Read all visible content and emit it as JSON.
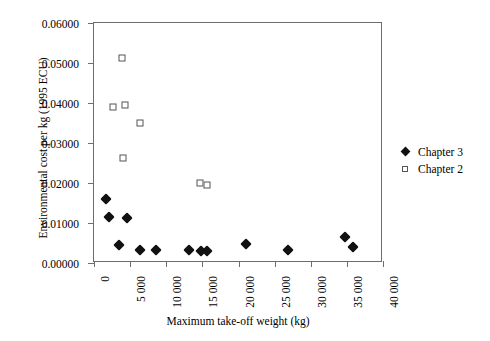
{
  "chart_data": {
    "type": "scatter",
    "title": "",
    "xlabel": "Maximum take-off weight (kg)",
    "ylabel": "Environmental cost per kg (1995 ECU)",
    "xlim": [
      0,
      40000
    ],
    "ylim": [
      0,
      0.06
    ],
    "grid": false,
    "legend_position": "right",
    "xticks": [
      0,
      5000,
      10000,
      15000,
      20000,
      25000,
      30000,
      35000,
      40000
    ],
    "xtick_labels": [
      "0",
      "5 000",
      "10 000",
      "15 000",
      "20 000",
      "25 000",
      "30 000",
      "35 000",
      "40 000"
    ],
    "yticks": [
      0,
      0.01,
      0.02,
      0.03,
      0.04,
      0.05,
      0.06
    ],
    "ytick_labels": [
      "0.00000",
      "0.01000",
      "0.02000",
      "0.03000",
      "0.04000",
      "0.05000",
      "0.06000"
    ],
    "series": [
      {
        "name": "Chapter 3",
        "marker": "filled-diamond",
        "color": "#111111",
        "points": [
          {
            "x": 1700,
            "y": 0.0161
          },
          {
            "x": 2100,
            "y": 0.0114
          },
          {
            "x": 3400,
            "y": 0.0044
          },
          {
            "x": 4600,
            "y": 0.0112
          },
          {
            "x": 6400,
            "y": 0.0033
          },
          {
            "x": 8600,
            "y": 0.0033
          },
          {
            "x": 13200,
            "y": 0.0033
          },
          {
            "x": 14800,
            "y": 0.003
          },
          {
            "x": 15700,
            "y": 0.003
          },
          {
            "x": 21000,
            "y": 0.0048
          },
          {
            "x": 26800,
            "y": 0.0033
          },
          {
            "x": 34800,
            "y": 0.0064
          },
          {
            "x": 35800,
            "y": 0.004
          }
        ]
      },
      {
        "name": "Chapter 2",
        "marker": "open-square",
        "color": "#555555",
        "points": [
          {
            "x": 3900,
            "y": 0.0513
          },
          {
            "x": 2600,
            "y": 0.039
          },
          {
            "x": 4300,
            "y": 0.0394
          },
          {
            "x": 6400,
            "y": 0.0351
          },
          {
            "x": 4000,
            "y": 0.0262
          },
          {
            "x": 14700,
            "y": 0.02
          },
          {
            "x": 15600,
            "y": 0.0196
          }
        ]
      }
    ]
  },
  "legend": {
    "entries": [
      {
        "label": "Chapter 3",
        "marker": "filled-diamond"
      },
      {
        "label": "Chapter 2",
        "marker": "open-square"
      }
    ]
  }
}
